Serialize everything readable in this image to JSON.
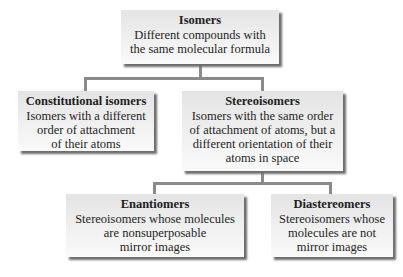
{
  "diagram": {
    "type": "hierarchy-tree",
    "nodes": {
      "isomers": {
        "title": "Isomers",
        "description": "Different compounds with\nthe same molecular formula"
      },
      "constitutional": {
        "title": "Constitutional isomers",
        "description": "Isomers with a different\norder of attachment\nof their atoms"
      },
      "stereoisomers": {
        "title": "Stereoisomers",
        "description": "Isomers with the same order\nof attachment of atoms, but a\ndifferent orientation of their\natoms in space"
      },
      "enantiomers": {
        "title": "Enantiomers",
        "description": "Stereoisomers whose molecules\nare nonsuperposable\nmirror images"
      },
      "diastereomers": {
        "title": "Diastereomers",
        "description": "Stereoisomers whose\nmolecules are not\nmirror images"
      }
    },
    "edges": [
      {
        "from": "Isomers",
        "to": "Constitutional isomers"
      },
      {
        "from": "Isomers",
        "to": "Stereoisomers"
      },
      {
        "from": "Stereoisomers",
        "to": "Enantiomers"
      },
      {
        "from": "Stereoisomers",
        "to": "Diastereomers"
      }
    ],
    "colors": {
      "connector": "#8a8a8a",
      "box_fill_top": "#e4e4e4",
      "box_fill_bottom": "#fafafa",
      "shadow": "#6e6e6e",
      "text": "#1e1e1e"
    }
  }
}
